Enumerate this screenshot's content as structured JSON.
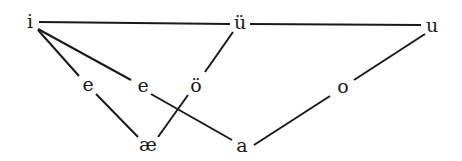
{
  "diagram": {
    "type": "vowel-chart",
    "nodes": [
      {
        "id": "i",
        "label": "i",
        "x": 30,
        "y": 21
      },
      {
        "id": "u_umlaut",
        "label": "ü",
        "x": 239,
        "y": 22
      },
      {
        "id": "u",
        "label": "u",
        "x": 432,
        "y": 25
      },
      {
        "id": "e1",
        "label": "e",
        "x": 88,
        "y": 84
      },
      {
        "id": "e2",
        "label": "e",
        "x": 143,
        "y": 85
      },
      {
        "id": "o_umlaut",
        "label": "ö",
        "x": 196,
        "y": 85
      },
      {
        "id": "o",
        "label": "o",
        "x": 343,
        "y": 86
      },
      {
        "id": "ae",
        "label": "æ",
        "x": 148,
        "y": 144
      },
      {
        "id": "a",
        "label": "a",
        "x": 242,
        "y": 145
      }
    ],
    "edges": [
      {
        "from": "i",
        "to": "u_umlaut"
      },
      {
        "from": "u_umlaut",
        "to": "u"
      },
      {
        "from": "i",
        "to": "e1"
      },
      {
        "from": "e1",
        "to": "ae"
      },
      {
        "from": "i",
        "to": "e2"
      },
      {
        "from": "e2",
        "to": "a"
      },
      {
        "from": "u_umlaut",
        "to": "o_umlaut"
      },
      {
        "from": "o_umlaut",
        "to": "ae"
      },
      {
        "from": "u",
        "to": "o"
      },
      {
        "from": "o",
        "to": "a"
      }
    ]
  }
}
